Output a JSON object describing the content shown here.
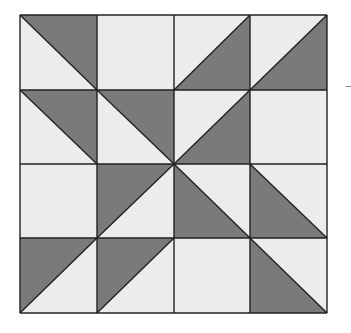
{
  "diagram": {
    "type": "quilt-block",
    "rows": 4,
    "cols": 4,
    "grid_x": [
      20,
      97,
      174,
      250,
      327
    ],
    "grid_y": [
      15,
      90,
      164,
      238,
      313
    ],
    "colors": {
      "dark": "#7a7a7a",
      "light": "#ececec",
      "line": "#222222",
      "background": "#ffffff"
    },
    "cells": [
      [
        {
          "diagonal": "tl-br",
          "dark": "upper-right"
        },
        {
          "diagonal": "none",
          "dark": "none"
        },
        {
          "diagonal": "bl-tr",
          "dark": "lower-right"
        },
        {
          "diagonal": "bl-tr",
          "dark": "lower-right"
        }
      ],
      [
        {
          "diagonal": "tl-br",
          "dark": "upper-right"
        },
        {
          "diagonal": "tl-br",
          "dark": "upper-right"
        },
        {
          "diagonal": "bl-tr",
          "dark": "lower-right"
        },
        {
          "diagonal": "none",
          "dark": "none"
        }
      ],
      [
        {
          "diagonal": "none",
          "dark": "none"
        },
        {
          "diagonal": "bl-tr",
          "dark": "upper-left"
        },
        {
          "diagonal": "tl-br",
          "dark": "lower-left"
        },
        {
          "diagonal": "tl-br",
          "dark": "lower-left"
        }
      ],
      [
        {
          "diagonal": "bl-tr",
          "dark": "upper-left"
        },
        {
          "diagonal": "bl-tr",
          "dark": "upper-left"
        },
        {
          "diagonal": "none",
          "dark": "none"
        },
        {
          "diagonal": "tl-br",
          "dark": "lower-left"
        }
      ]
    ]
  }
}
